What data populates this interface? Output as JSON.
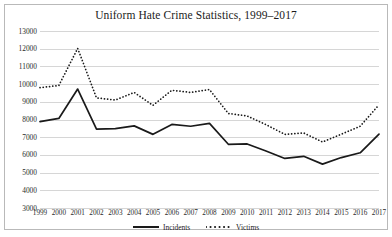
{
  "chart_data": {
    "type": "line",
    "title": "Uniform Hate Crime Statistics, 1999–2017",
    "xlabel": "",
    "ylabel": "",
    "x": [
      1999,
      2000,
      2001,
      2002,
      2003,
      2004,
      2005,
      2006,
      2007,
      2008,
      2009,
      2010,
      2011,
      2012,
      2013,
      2014,
      2015,
      2016,
      2017
    ],
    "categories": [
      "1999",
      "2000",
      "2001",
      "2002",
      "2003",
      "2004",
      "2005",
      "2006",
      "2007",
      "2008",
      "2009",
      "2010",
      "2011",
      "2012",
      "2013",
      "2014",
      "2015",
      "2016",
      "2017"
    ],
    "series": [
      {
        "name": "Incidents",
        "style": "solid",
        "color": "#1a1a1a",
        "values": [
          7880,
          8060,
          9720,
          7460,
          7480,
          7640,
          7160,
          7720,
          7620,
          7780,
          6600,
          6620,
          6220,
          5800,
          5920,
          5480,
          5850,
          6120,
          7170
        ]
      },
      {
        "name": "Victims",
        "style": "dotted",
        "color": "#1a1a1a",
        "values": [
          9800,
          9920,
          12020,
          9220,
          9100,
          9530,
          8800,
          9650,
          9530,
          9690,
          8340,
          8200,
          7710,
          7160,
          7240,
          6730,
          7170,
          7620,
          8830
        ]
      }
    ],
    "ylim": [
      3000,
      13000
    ],
    "yticks": [
      3000,
      4000,
      5000,
      6000,
      7000,
      8000,
      9000,
      10000,
      11000,
      12000,
      13000
    ],
    "ytick_labels": [
      "3000",
      "4000",
      "5000",
      "6000",
      "7000",
      "8000",
      "9000",
      "10000",
      "11000",
      "12000",
      "13000"
    ],
    "grid": "horizontal",
    "legend_position": "bottom-center",
    "legend": [
      "Incidents",
      "Victims"
    ]
  }
}
